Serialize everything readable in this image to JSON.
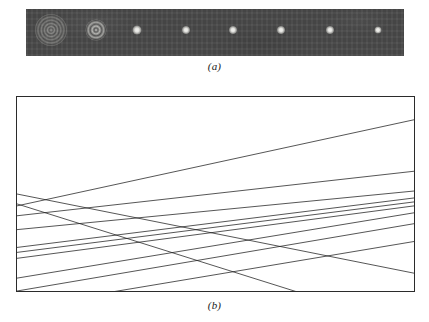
{
  "figure": {
    "panels": [
      {
        "id": "a",
        "caption": "(a)",
        "type": "photographic-strip",
        "description": "Series of eight recorded point-spread images taken at successive focal planes"
      },
      {
        "id": "b",
        "caption": "(b)",
        "type": "ray-diagram",
        "description": "Meridional ray trace of a spherically aberrated pencil forming a caustic"
      }
    ]
  },
  "panel_a": {
    "caption": "(a)",
    "strip": {
      "x": 26,
      "y": 9,
      "width": 378,
      "height": 47,
      "background_color": "#4a4a4a"
    },
    "spots": [
      {
        "index": 1,
        "cx": 51,
        "cy": 30,
        "d": 32,
        "kind": "rings-large",
        "rings": 7,
        "label": "far-from-focus ring pattern"
      },
      {
        "index": 2,
        "cx": 96,
        "cy": 30,
        "d": 21,
        "kind": "rings-medium",
        "rings": 4,
        "label": "intermediate ring pattern"
      },
      {
        "index": 3,
        "cx": 137,
        "cy": 30,
        "d": 9,
        "kind": "blob",
        "rings": 0,
        "label": "near-focus disc"
      },
      {
        "index": 4,
        "cx": 186,
        "cy": 30,
        "d": 8,
        "kind": "blob",
        "rings": 0,
        "label": "near-focus disc"
      },
      {
        "index": 5,
        "cx": 233,
        "cy": 30,
        "d": 8,
        "kind": "blob",
        "rings": 0,
        "label": "near-focus disc"
      },
      {
        "index": 6,
        "cx": 281,
        "cy": 30,
        "d": 8,
        "kind": "blob",
        "rings": 0,
        "label": "focal disc"
      },
      {
        "index": 7,
        "cx": 330,
        "cy": 30,
        "d": 8,
        "kind": "blob",
        "rings": 0,
        "label": "focal disc"
      },
      {
        "index": 8,
        "cx": 378,
        "cy": 30,
        "d": 7,
        "kind": "blob",
        "rings": 0,
        "label": "focal disc"
      }
    ]
  },
  "chart_data": {
    "type": "line",
    "subtitle": "",
    "xlabel": "",
    "ylabel": "",
    "xlim": [
      0,
      399
    ],
    "ylim": [
      0,
      196
    ],
    "grid": false,
    "legend": "none",
    "box": {
      "x": 16,
      "y": 96,
      "width": 399,
      "height": 196,
      "stroke": "#2b2b2b",
      "stroke_width": 1
    },
    "axis_note": "Coordinates are in panel-local pixels; y increases downward.",
    "series": [
      {
        "name": "ray-1",
        "x": [
          0,
          399
        ],
        "y": [
          110,
          23
        ],
        "stroke": "#1d1d1d"
      },
      {
        "name": "ray-2",
        "x": [
          0,
          399
        ],
        "y": [
          120,
          75
        ],
        "stroke": "#1d1d1d"
      },
      {
        "name": "ray-3",
        "x": [
          0,
          399
        ],
        "y": [
          134,
          95
        ],
        "stroke": "#1d1d1d"
      },
      {
        "name": "ray-4",
        "x": [
          0,
          399
        ],
        "y": [
          152,
          102
        ],
        "stroke": "#1d1d1d"
      },
      {
        "name": "ray-5",
        "x": [
          0,
          399
        ],
        "y": [
          157,
          106
        ],
        "stroke": "#1d1d1d"
      },
      {
        "name": "ray-6",
        "x": [
          0,
          399
        ],
        "y": [
          163,
          110
        ],
        "stroke": "#1d1d1d"
      },
      {
        "name": "ray-7",
        "x": [
          0,
          399
        ],
        "y": [
          183,
          117
        ],
        "stroke": "#1d1d1d"
      },
      {
        "name": "ray-8",
        "x": [
          0,
          399
        ],
        "y": [
          196,
          128
        ],
        "stroke": "#1d1d1d"
      },
      {
        "name": "ray-9",
        "x": [
          0,
          399
        ],
        "y": [
          213,
          146
        ],
        "stroke": "#1d1d1d"
      },
      {
        "name": "ray-10",
        "x": [
          0,
          399
        ],
        "y": [
          98,
          178
        ],
        "stroke": "#1d1d1d"
      },
      {
        "name": "ray-11",
        "x": [
          0,
          399
        ],
        "y": [
          108,
          234
        ],
        "stroke": "#1d1d1d"
      }
    ],
    "caustic_crossing_zone": {
      "x_start": 170,
      "x_end": 300,
      "y_center": 112
    }
  },
  "panel_b": {
    "caption": "(b)"
  }
}
